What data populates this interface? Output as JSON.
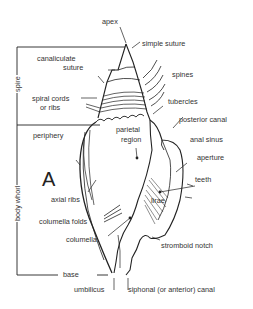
{
  "diagram": {
    "figure_letter": "A",
    "brackets": {
      "spire": "spire",
      "body_whorl": "body whorl"
    },
    "labels": {
      "apex": "apex",
      "simple_suture": "simple suture",
      "canaliculate_1": "canaliculate",
      "canaliculate_2": "suture",
      "spines": "spines",
      "spiral_1": "spiral cords",
      "spiral_2": "or ribs",
      "tubercles": "tubercles",
      "posterior_canal": "posterior canal",
      "periphery": "periphery",
      "parietal_1": "parietal",
      "parietal_2": "region",
      "anal_sinus": "anal sinus",
      "aperture": "aperture",
      "teeth": "teeth",
      "axial_ribs": "axial ribs",
      "lirae": "lirae",
      "columella_folds": "columella folds",
      "columella": "columella",
      "stromboid_notch": "stromboid notch",
      "base": "base",
      "umbilicus": "umbilicus",
      "siphonal_canal": "siphonal (or anterior) canal"
    }
  }
}
